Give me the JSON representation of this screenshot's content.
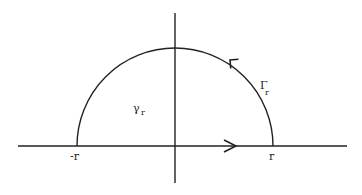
{
  "diagram": {
    "type": "contour",
    "colors": {
      "stroke": "#222222",
      "background": "#ffffff"
    },
    "labels": {
      "neg_r": "-r",
      "pos_r": "r",
      "gamma_region": "γ",
      "gamma_sub": "r",
      "Gamma_arc": "Γ",
      "Gamma_sub": "r"
    },
    "axes": {
      "horizontal": {
        "x1": 18,
        "x2": 347,
        "y": 146
      },
      "vertical": {
        "x": 175,
        "y1": 13,
        "y2": 183
      }
    },
    "semicircle": {
      "cx": 175,
      "cy": 146,
      "r": 98
    },
    "arrows": [
      {
        "on": "real-axis",
        "direction": "right"
      },
      {
        "on": "arc",
        "direction": "counterclockwise"
      }
    ]
  }
}
